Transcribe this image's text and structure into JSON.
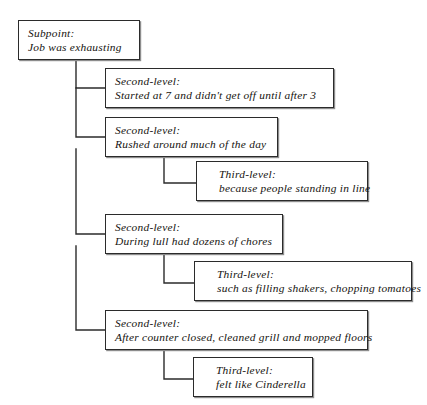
{
  "diagram": {
    "type": "hierarchical-outline-tree",
    "orientation": "top-down-left-indented",
    "line_color": "#2b2b2b",
    "background_color": "#ffffff",
    "text_color": "#15130f",
    "nodes": [
      {
        "id": "subpoint",
        "level": 1,
        "label": "Subpoint:",
        "body": "Job was exhausting",
        "x": 18,
        "y": 20,
        "w": 122,
        "h": 40
      },
      {
        "id": "second-1",
        "level": 2,
        "label": "Second-level:",
        "body": "Started at 7 and didn't get off until after 3",
        "x": 105,
        "y": 68,
        "w": 229,
        "h": 40
      },
      {
        "id": "second-2",
        "level": 2,
        "label": "Second-level:",
        "body": "Rushed around much of the day",
        "x": 105,
        "y": 117,
        "w": 173,
        "h": 40
      },
      {
        "id": "third-1",
        "level": 3,
        "label": "Third-level:",
        "body": "because people standing in line",
        "x": 196,
        "y": 161,
        "w": 172,
        "h": 40
      },
      {
        "id": "second-3",
        "level": 2,
        "label": "Second-level:",
        "body": "During lull had dozens of chores",
        "x": 105,
        "y": 214,
        "w": 178,
        "h": 40
      },
      {
        "id": "third-2",
        "level": 3,
        "label": "Third-level:",
        "body": "such as filling shakers, chopping tomatoes",
        "x": 194,
        "y": 261,
        "w": 218,
        "h": 40
      },
      {
        "id": "second-4",
        "level": 2,
        "label": "Second-level:",
        "body": "After counter closed, cleaned grill and mopped floors",
        "x": 105,
        "y": 310,
        "w": 263,
        "h": 40
      },
      {
        "id": "third-3",
        "level": 3,
        "label": "Third-level:",
        "body": "felt like Cinderella",
        "x": 193,
        "y": 357,
        "w": 120,
        "h": 40
      }
    ]
  }
}
